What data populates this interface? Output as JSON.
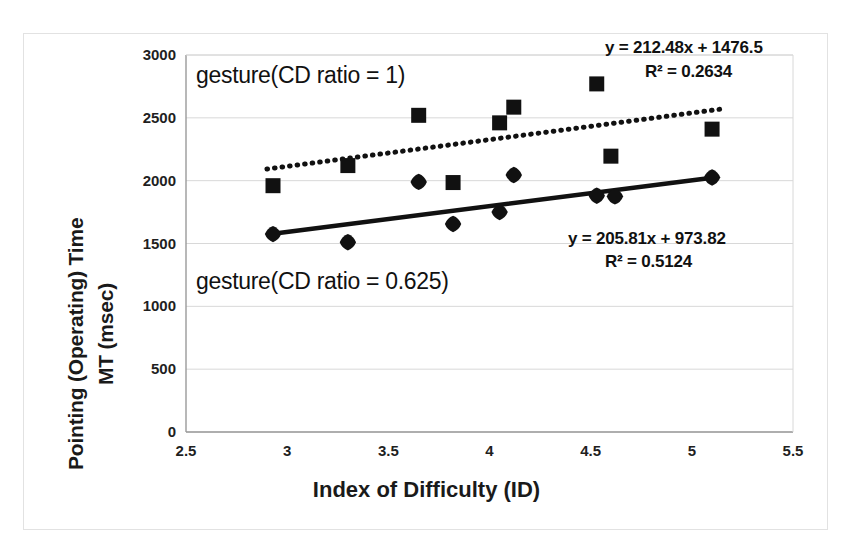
{
  "chart_data": {
    "type": "scatter",
    "title": "",
    "xlabel": "Index of Difficulty (ID)",
    "ylabel_line1": "Pointing (Operating) Time",
    "ylabel_line2": "MT (msec)",
    "xlim": [
      2.5,
      5.5
    ],
    "ylim": [
      0,
      3000
    ],
    "xticks": [
      "2.5",
      "3",
      "3.5",
      "4",
      "4.5",
      "5",
      "5.5"
    ],
    "xtick_values": [
      2.5,
      3,
      3.5,
      4,
      4.5,
      5,
      5.5
    ],
    "yticks": [
      "0",
      "500",
      "1000",
      "1500",
      "2000",
      "2500",
      "3000"
    ],
    "ytick_values": [
      0,
      500,
      1000,
      1500,
      2000,
      2500,
      3000
    ],
    "grid": "horizontal",
    "legend_position": "inline-annotation",
    "series": [
      {
        "name": "gesture(CD ratio = 1)",
        "marker": "square",
        "color": "#111111",
        "trendline": {
          "style": "dotted",
          "equation": "y = 212.48x + 1476.5",
          "r2": "R² = 0.2634",
          "slope": 212.48,
          "intercept": 1476.5,
          "r2_value": 0.2634,
          "x_start": 2.9,
          "x_end": 5.15
        },
        "points": [
          {
            "x": 2.93,
            "y": 1960
          },
          {
            "x": 3.3,
            "y": 2120
          },
          {
            "x": 3.65,
            "y": 2520
          },
          {
            "x": 3.82,
            "y": 1985
          },
          {
            "x": 4.05,
            "y": 2460
          },
          {
            "x": 4.12,
            "y": 2585
          },
          {
            "x": 4.53,
            "y": 2770
          },
          {
            "x": 4.6,
            "y": 2195
          },
          {
            "x": 5.1,
            "y": 2410
          }
        ]
      },
      {
        "name": "gesture(CD ratio = 0.625)",
        "marker": "diamond",
        "color": "#111111",
        "trendline": {
          "style": "solid",
          "equation": "y = 205.81x + 973.82",
          "r2": "R² = 0.5124",
          "slope": 205.81,
          "intercept": 973.82,
          "r2_value": 0.5124,
          "x_start": 2.93,
          "x_end": 5.12
        },
        "points": [
          {
            "x": 2.93,
            "y": 1575
          },
          {
            "x": 3.3,
            "y": 1510
          },
          {
            "x": 3.65,
            "y": 1990
          },
          {
            "x": 3.82,
            "y": 1655
          },
          {
            "x": 4.05,
            "y": 1750
          },
          {
            "x": 4.12,
            "y": 2045
          },
          {
            "x": 4.53,
            "y": 1880
          },
          {
            "x": 4.62,
            "y": 1875
          },
          {
            "x": 5.1,
            "y": 2025
          }
        ]
      }
    ],
    "annotations": [
      {
        "id": "label-upper",
        "text": "gesture(CD ratio = 1)"
      },
      {
        "id": "label-lower",
        "text": "gesture(CD ratio = 0.625)"
      },
      {
        "id": "eq-upper-line1",
        "text": "y = 212.48x + 1476.5"
      },
      {
        "id": "eq-upper-line2",
        "text": "R² = 0.2634"
      },
      {
        "id": "eq-lower-line1",
        "text": "y = 205.81x + 973.82"
      },
      {
        "id": "eq-lower-line2",
        "text": "R² = 0.5124"
      }
    ]
  },
  "labels": {
    "upper_group": "gesture(CD ratio = 1)",
    "lower_group": "gesture(CD ratio = 0.625)",
    "eq_upper": "y = 212.48x + 1476.5",
    "r2_upper": "R² = 0.2634",
    "eq_lower": "y = 205.81x + 973.82",
    "r2_lower": "R² = 0.5124",
    "x_axis_title": "Index of Difficulty (ID)",
    "y_axis_title_line1": "Pointing (Operating) Time",
    "y_axis_title_line2": "MT (msec)"
  },
  "colors": {
    "marker": "#111111",
    "trend_solid": "#111111",
    "trend_dotted": "#111111",
    "grid": "#d8d8d8",
    "axis": "#9a9a9a",
    "frame": "#e2e2e2",
    "text": "#1a1a1a",
    "background": "#ffffff"
  }
}
